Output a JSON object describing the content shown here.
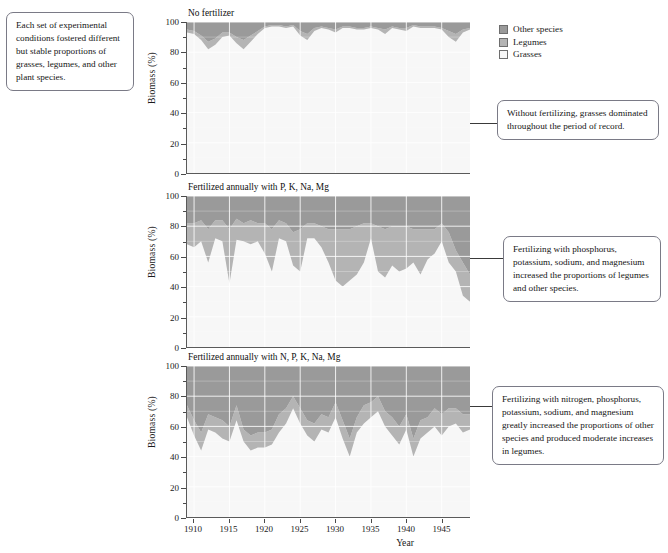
{
  "notes": {
    "intro": "Each set of experimental conditions fostered different but stable proportions of grasses, legumes, and other plant species.",
    "panel1": "Without fertilizing, grasses dominated throughout the period of record.",
    "panel2": "Fertilizing with phosphorus, potassium, sodium, and magnesium increased the proportions of legumes and other species.",
    "panel3": "Fertilizing with nitrogen, phosphorus, potassium, sodium, and magnesium greatly increased the proportions of other species and produced moderate increases in legumes."
  },
  "legend": {
    "position": "top-right",
    "items": [
      {
        "label": "Other species",
        "color": "#9a9a9a"
      },
      {
        "label": "Legumes",
        "color": "#b4b4b4"
      },
      {
        "label": "Grasses",
        "color": "#f7f7f7"
      }
    ]
  },
  "axes": {
    "xlabel": "Year",
    "ylabel": "Biomass (%)",
    "xticks": [
      1910,
      1915,
      1920,
      1925,
      1930,
      1935,
      1940,
      1945
    ],
    "xlim": [
      1909,
      1949
    ],
    "yticks": [
      0,
      20,
      40,
      60,
      80,
      100
    ],
    "yminor": [
      10,
      30,
      50,
      70,
      90
    ],
    "ylim": [
      0,
      100
    ],
    "grid": true,
    "grid_color": "#ffffff",
    "plot_background": "#f2f2f2"
  },
  "chart_data": {
    "type": "area",
    "xlabel": "Year",
    "ylabel": "Biomass (%)",
    "xlim": [
      1909,
      1949
    ],
    "ylim": [
      0,
      100
    ],
    "stacked": true,
    "stack_order_bottom_to_top": [
      "Grasses",
      "Legumes",
      "Other species"
    ],
    "x": [
      1909,
      1910,
      1911,
      1912,
      1913,
      1914,
      1915,
      1916,
      1917,
      1918,
      1919,
      1920,
      1921,
      1922,
      1923,
      1924,
      1925,
      1926,
      1927,
      1928,
      1929,
      1930,
      1931,
      1932,
      1933,
      1934,
      1935,
      1936,
      1937,
      1938,
      1939,
      1940,
      1941,
      1942,
      1943,
      1944,
      1945,
      1946,
      1947,
      1948,
      1949
    ],
    "panels": [
      {
        "title": "No fertilizer",
        "series": [
          {
            "name": "Grasses",
            "values": [
              93,
              92,
              88,
              82,
              85,
              90,
              91,
              86,
              82,
              87,
              92,
              96,
              97,
              97,
              96,
              97,
              91,
              88,
              94,
              96,
              95,
              93,
              96,
              96,
              95,
              95,
              96,
              95,
              92,
              96,
              95,
              94,
              97,
              96,
              96,
              96,
              95,
              90,
              87,
              93,
              95
            ]
          },
          {
            "name": "Legumes",
            "values": [
              2,
              2,
              3,
              5,
              4,
              3,
              2,
              4,
              6,
              4,
              2,
              1,
              1,
              1,
              1,
              1,
              3,
              4,
              2,
              1,
              1,
              2,
              1,
              1,
              1,
              1,
              1,
              1,
              3,
              1,
              1,
              2,
              1,
              1,
              1,
              1,
              1,
              4,
              5,
              2,
              1
            ]
          },
          {
            "name": "Other species",
            "values": [
              5,
              6,
              9,
              13,
              11,
              7,
              7,
              10,
              12,
              9,
              6,
              3,
              2,
              2,
              3,
              2,
              6,
              8,
              4,
              3,
              4,
              5,
              3,
              3,
              4,
              4,
              3,
              4,
              5,
              3,
              4,
              4,
              2,
              3,
              3,
              3,
              4,
              6,
              8,
              5,
              4
            ]
          }
        ]
      },
      {
        "title": "Fertilized annually with P, K, Na, Mg",
        "series": [
          {
            "name": "Grasses",
            "values": [
              68,
              66,
              70,
              56,
              72,
              70,
              42,
              71,
              70,
              68,
              70,
              62,
              50,
              72,
              70,
              54,
              50,
              72,
              72,
              66,
              56,
              44,
              40,
              44,
              48,
              56,
              72,
              50,
              46,
              54,
              50,
              52,
              56,
              48,
              58,
              62,
              70,
              56,
              50,
              34,
              30
            ]
          },
          {
            "name": "Legumes",
            "values": [
              14,
              16,
              14,
              22,
              12,
              14,
              36,
              14,
              12,
              16,
              12,
              20,
              28,
              12,
              12,
              22,
              28,
              10,
              10,
              14,
              22,
              34,
              38,
              34,
              32,
              26,
              10,
              30,
              32,
              26,
              30,
              28,
              22,
              30,
              20,
              16,
              12,
              20,
              14,
              22,
              18
            ]
          },
          {
            "name": "Other species",
            "values": [
              18,
              18,
              16,
              22,
              16,
              16,
              22,
              15,
              18,
              16,
              18,
              18,
              22,
              16,
              18,
              24,
              22,
              18,
              18,
              20,
              22,
              22,
              22,
              22,
              20,
              18,
              18,
              20,
              22,
              20,
              20,
              20,
              22,
              22,
              22,
              22,
              18,
              24,
              36,
              44,
              52
            ]
          }
        ]
      },
      {
        "title": "Fertilized annually with N, P, K, Na, Mg",
        "series": [
          {
            "name": "Grasses",
            "values": [
              66,
              54,
              44,
              58,
              56,
              52,
              50,
              64,
              50,
              44,
              46,
              46,
              48,
              56,
              62,
              72,
              62,
              54,
              50,
              58,
              56,
              66,
              52,
              40,
              56,
              62,
              66,
              70,
              60,
              54,
              48,
              58,
              40,
              52,
              56,
              60,
              54,
              60,
              62,
              56,
              58
            ]
          },
          {
            "name": "Legumes",
            "values": [
              8,
              10,
              12,
              10,
              10,
              12,
              10,
              10,
              8,
              10,
              10,
              10,
              10,
              12,
              10,
              8,
              10,
              10,
              12,
              10,
              10,
              10,
              12,
              12,
              10,
              12,
              10,
              10,
              10,
              12,
              12,
              10,
              12,
              12,
              10,
              12,
              14,
              12,
              10,
              12,
              10
            ]
          },
          {
            "name": "Other species",
            "values": [
              26,
              36,
              44,
              32,
              34,
              36,
              40,
              26,
              42,
              46,
              44,
              44,
              42,
              32,
              28,
              20,
              28,
              36,
              38,
              32,
              34,
              24,
              36,
              48,
              34,
              26,
              24,
              20,
              30,
              34,
              40,
              32,
              48,
              36,
              34,
              28,
              32,
              28,
              28,
              32,
              32
            ]
          }
        ]
      }
    ]
  }
}
